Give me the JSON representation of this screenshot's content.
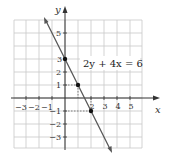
{
  "chart_data": {
    "type": "line",
    "title": "",
    "xlabel": "x",
    "ylabel": "y",
    "xlim": [
      -4,
      6
    ],
    "ylim": [
      -4,
      6
    ],
    "grid": true,
    "x_ticks": [
      -3,
      -2,
      -1,
      2,
      3,
      4,
      5
    ],
    "x_tick_labels": [
      "−3",
      "−2",
      "−1",
      "2",
      "3",
      "4",
      "5"
    ],
    "y_ticks": [
      5,
      3,
      2,
      1,
      -1,
      -2,
      -3
    ],
    "y_tick_labels": [
      "5",
      "3",
      "2",
      "1",
      "−1",
      "−2",
      "−3"
    ],
    "series": [
      {
        "name": "2y + 4x = 6",
        "equation": "2y + 4x = 6",
        "slope": -2,
        "intercept": 3,
        "x": [
          -0.5,
          3.5
        ],
        "y": [
          4,
          -4
        ]
      }
    ],
    "points": [
      {
        "x": 0,
        "y": 3
      },
      {
        "x": 1,
        "y": 1
      },
      {
        "x": 2,
        "y": -1
      }
    ],
    "annotations": [
      {
        "text": "2y + 4x = 6",
        "x": 2,
        "y": 2.7
      }
    ]
  },
  "labels": {
    "x_axis": "x",
    "y_axis": "y",
    "equation": "2y + 4x = 6",
    "x_ticks": [
      "−3",
      "−2",
      "−1",
      "2",
      "3",
      "4",
      "5"
    ],
    "y_ticks": [
      "5",
      "3",
      "2",
      "1",
      "−1",
      "−2",
      "−3"
    ]
  },
  "colors": {
    "grid": "#c8c8c8",
    "axis": "#333333",
    "line": "#555555",
    "point": "#111111"
  }
}
